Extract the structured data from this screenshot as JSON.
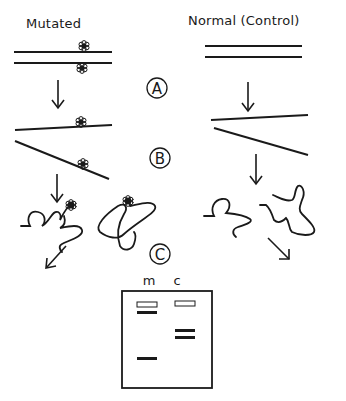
{
  "columns": {
    "left": {
      "title": "Mutated"
    },
    "right": {
      "title": "Normal (Control)"
    }
  },
  "steps": [
    {
      "label": "A"
    },
    {
      "label": "B"
    },
    {
      "label": "C"
    }
  ],
  "gel": {
    "lanes": [
      {
        "label": "m",
        "bands": [
          "well",
          "high",
          "low"
        ]
      },
      {
        "label": "c",
        "bands": [
          "well",
          "mid-1",
          "mid-2"
        ]
      }
    ]
  },
  "colors": {
    "ink": "#1a1a1a",
    "background": "#ffffff"
  }
}
